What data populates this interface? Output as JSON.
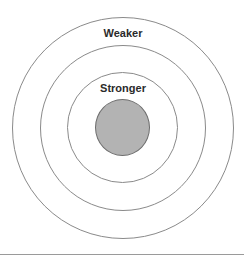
{
  "diagram": {
    "type": "concentric-circles",
    "center": {
      "x": 122.5,
      "y": 128
    },
    "rings": [
      {
        "name": "outer-ring",
        "radius": 111
      },
      {
        "name": "middle-ring",
        "radius": 83
      },
      {
        "name": "inner-ring",
        "radius": 56
      }
    ],
    "core": {
      "radius": 28,
      "fill": "#b3b3b3"
    },
    "labels": {
      "weaker": "Weaker",
      "stronger": "Stronger"
    },
    "colors": {
      "ring_stroke": "#8a8a8a",
      "core_fill": "#b3b3b3",
      "text": "#2b2b2b",
      "divider": "#9a9a9a"
    }
  }
}
